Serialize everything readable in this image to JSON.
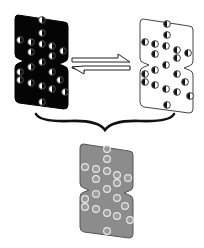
{
  "diagram": {
    "colors": {
      "black_state": "#050505",
      "white_state": "#ffffff",
      "averaged_state": "#8c8c8c",
      "outline": "#333333"
    },
    "states": [
      {
        "name": "black-state",
        "fill": "#050505"
      },
      {
        "name": "white-state",
        "fill": "#ffffff"
      },
      {
        "name": "averaged-gray-state",
        "fill": "#8c8c8c"
      }
    ],
    "arrows": {
      "forward": "right",
      "reverse": "left",
      "type": "equilibrium"
    },
    "connector": "curly-brace"
  }
}
